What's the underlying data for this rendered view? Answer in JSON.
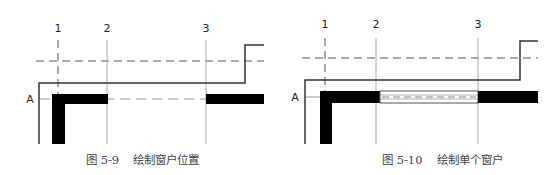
{
  "figures": [
    {
      "id": "fig-5-9",
      "caption_number": "图 5-9",
      "caption_title": "绘制窗户位置",
      "grid_labels": [
        "1",
        "2",
        "3"
      ],
      "axis_label": "A",
      "has_window": false
    },
    {
      "id": "fig-5-10",
      "caption_number": "图 5-10",
      "caption_title": "绘制单个窗户",
      "grid_labels": [
        "1",
        "2",
        "3"
      ],
      "axis_label": "A",
      "has_window": true
    }
  ],
  "colors": {
    "wall": "#000000",
    "line": "#333333",
    "grid": "#999999",
    "caption": "#444444"
  }
}
